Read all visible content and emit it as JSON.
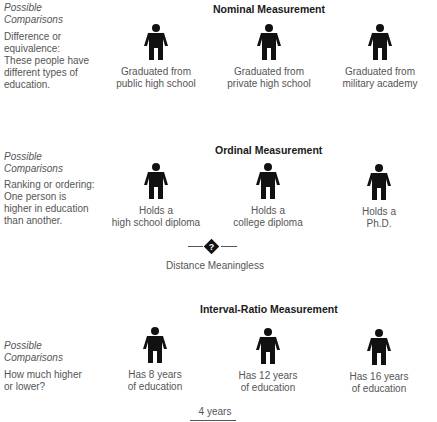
{
  "sections": [
    {
      "title": "Nominal Measurement",
      "possible_label": [
        "Possible",
        "Comparisons"
      ],
      "description": [
        "Difference or",
        "equivalence:",
        "These people have",
        "different types of",
        "education."
      ],
      "people": [
        {
          "caption": [
            "Graduated from",
            "public high school"
          ]
        },
        {
          "caption": [
            "Graduated from",
            "private high school"
          ]
        },
        {
          "caption": [
            "Graduated from",
            "military academy"
          ]
        }
      ]
    },
    {
      "title": "Ordinal Measurement",
      "possible_label": [
        "Possible",
        "Comparisons"
      ],
      "description": [
        "Ranking or ordering:",
        "One person is",
        "higher in education",
        "than another."
      ],
      "people": [
        {
          "caption": [
            "Holds a",
            "high school diploma"
          ]
        },
        {
          "caption": [
            "Holds a",
            "college diploma"
          ]
        },
        {
          "caption": [
            "Holds a",
            "Ph.D."
          ]
        }
      ],
      "distance_icon": "question-diamond-icon",
      "distance_label": "Distance Meaningless"
    },
    {
      "title": "Interval-Ratio Measurement",
      "possible_label": [
        "Possible",
        "Comparisons"
      ],
      "description": [
        "How much higher",
        "or lower?"
      ],
      "people": [
        {
          "caption": [
            "Has 8 years",
            "of education"
          ]
        },
        {
          "caption": [
            "Has 12 years",
            "of education"
          ]
        },
        {
          "caption": [
            "Has 16 years",
            "of education"
          ]
        }
      ],
      "distance_label": "4 years"
    }
  ],
  "icons": {
    "person": "person-silhouette-icon",
    "distance": "question-diamond-icon"
  },
  "colors": {
    "icon": "#111111",
    "text": "#555555",
    "title": "#1a1a1a"
  }
}
